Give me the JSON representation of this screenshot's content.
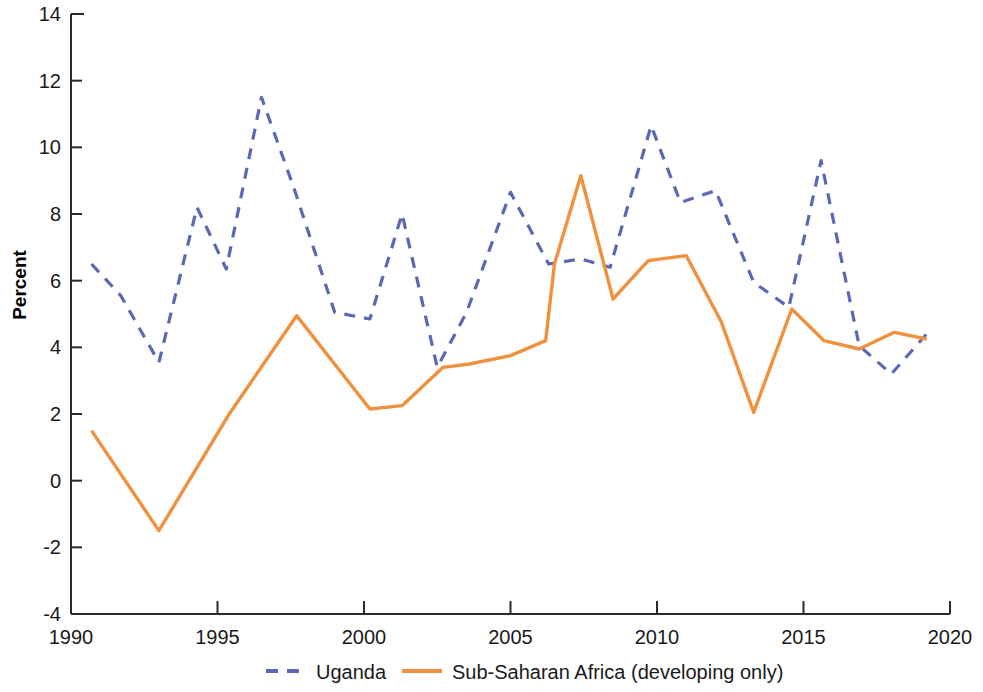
{
  "chart_data": {
    "type": "line",
    "title": "",
    "xlabel": "",
    "ylabel": "Percent",
    "xlim": [
      1990,
      2020
    ],
    "ylim": [
      -4,
      14
    ],
    "xticks": [
      "1990",
      "1995",
      "2000",
      "2005",
      "2010",
      "2015",
      "2020"
    ],
    "xtick_values": [
      1990,
      1995,
      2000,
      2005,
      2010,
      2015,
      2020
    ],
    "yticks": [
      "14",
      "12",
      "10",
      "8",
      "6",
      "4",
      "2",
      "0",
      "-2",
      "-4"
    ],
    "ytick_values": [
      14,
      12,
      10,
      8,
      6,
      4,
      2,
      0,
      -2,
      -4
    ],
    "grid": false,
    "legend_position": "bottom",
    "series": [
      {
        "name": "Uganda",
        "color": "#5b68b4",
        "style": "dashed",
        "x": [
          1990.7,
          1991.7,
          1993.0,
          1994.3,
          1995.3,
          1996.5,
          1997.6,
          1999.0,
          2000.2,
          2001.3,
          2002.5,
          2003.5,
          2005.0,
          2006.3,
          2007.4,
          2008.4,
          2009.8,
          2010.8,
          2012.0,
          2013.3,
          2014.5,
          2015.6,
          2016.9,
          2018.0,
          2019.2
        ],
        "y": [
          6.5,
          5.55,
          3.55,
          8.2,
          6.35,
          11.5,
          8.8,
          5.05,
          4.85,
          8.0,
          3.4,
          5.05,
          8.65,
          6.5,
          6.65,
          6.4,
          10.65,
          8.35,
          8.7,
          5.95,
          5.2,
          9.6,
          4.05,
          3.2,
          4.4
        ]
      },
      {
        "name": "Sub-Saharan Africa (developing only)",
        "color": "#f0913f",
        "style": "solid",
        "x": [
          1990.7,
          1993.0,
          1995.4,
          1997.7,
          2000.2,
          2001.3,
          2002.7,
          2003.6,
          2005.0,
          2006.2,
          2006.5,
          2007.4,
          2008.5,
          2009.7,
          2011.0,
          2012.2,
          2013.3,
          2014.6,
          2015.7,
          2016.9,
          2018.1,
          2019.2
        ],
        "y": [
          1.5,
          -1.5,
          2.0,
          4.95,
          2.15,
          2.25,
          3.4,
          3.5,
          3.75,
          4.2,
          6.5,
          9.15,
          5.45,
          6.6,
          6.75,
          4.75,
          2.05,
          5.15,
          4.2,
          3.95,
          4.45,
          4.25
        ]
      }
    ],
    "legend": [
      {
        "label": "Uganda",
        "color": "#5b68b4",
        "style": "dashed"
      },
      {
        "label": "Sub-Saharan Africa (developing only)",
        "color": "#f0913f",
        "style": "solid"
      }
    ]
  }
}
